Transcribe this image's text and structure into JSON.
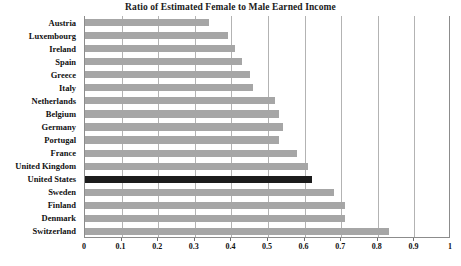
{
  "chart_data": {
    "type": "bar",
    "orientation": "horizontal",
    "title": "Ratio of Estimated Female to Male Earned Income",
    "xlabel": "",
    "ylabel": "",
    "xlim": [
      0,
      1
    ],
    "ylim": null,
    "grid": true,
    "legend": null,
    "xticks": [
      "0",
      "0.1",
      "0.2",
      "0.3",
      "0.4",
      "0.5",
      "0.6",
      "0.7",
      "0.8",
      "0.9",
      "1"
    ],
    "xtick_values": [
      0,
      0.1,
      0.2,
      0.3,
      0.4,
      0.5,
      0.6,
      0.7,
      0.8,
      0.9,
      1
    ],
    "categories": [
      "Austria",
      "Luxembourg",
      "Ireland",
      "Spain",
      "Greece",
      "Italy",
      "Netherlands",
      "Belgium",
      "Germany",
      "Portugal",
      "France",
      "United Kingdom",
      "United States",
      "Sweden",
      "Finland",
      "Denmark",
      "Switzerland"
    ],
    "values": [
      0.34,
      0.39,
      0.41,
      0.43,
      0.45,
      0.46,
      0.52,
      0.53,
      0.54,
      0.53,
      0.58,
      0.61,
      0.62,
      0.68,
      0.71,
      0.71,
      0.83
    ],
    "highlight_category": "United States",
    "colors": {
      "bar": "#a6a6a6",
      "bar_highlight": "#1c1c1c",
      "gridline": "#b3b3b3",
      "axis": "#8c8c8c",
      "text": "#111111",
      "background": "#ffffff"
    }
  }
}
